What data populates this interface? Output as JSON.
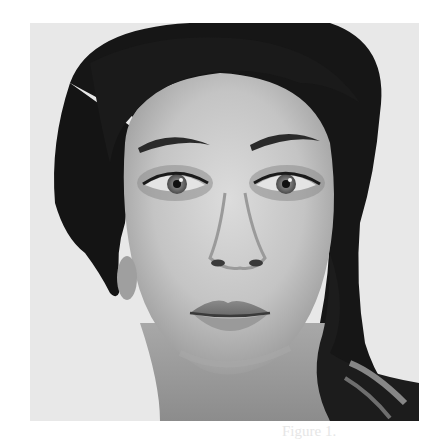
{
  "page": {
    "background_color": "#ffffff"
  },
  "photo": {
    "description": "Grayscale studio portrait of a young woman with dark hair swept to her left shoulder, looking straight at the camera",
    "style": "black-and-white",
    "background_color": "#e9e9e9",
    "subject": {
      "hair_color": "#141414",
      "skin_tone": "#c8c8c8",
      "expression": "neutral"
    }
  },
  "top_watermark": {
    "text": ""
  },
  "caption": {
    "text": "Figure 1."
  }
}
